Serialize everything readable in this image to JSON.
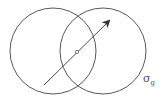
{
  "diagram": {
    "circles": [
      {
        "cx": 53,
        "cy": 51,
        "r": 43
      },
      {
        "cx": 103,
        "cy": 51,
        "r": 43
      }
    ],
    "arrow": {
      "x1": 44,
      "y1": 85,
      "x2": 110,
      "y2": 20
    },
    "center_point": {
      "cx": 77,
      "cy": 52,
      "r": 1.6
    },
    "label": {
      "symbol": "σ",
      "subscript": "g"
    },
    "stroke_color": "#444444"
  }
}
